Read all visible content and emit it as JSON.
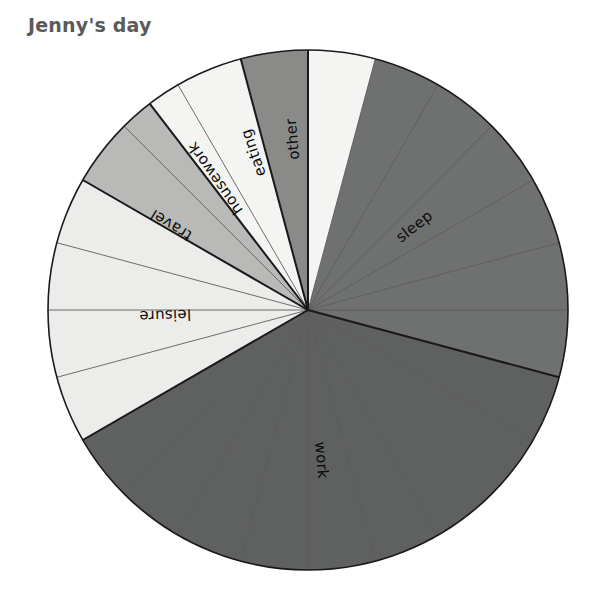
{
  "title": "Jenny's day",
  "chart_data": {
    "type": "pie",
    "title": "Jenny's day",
    "subtitle": "",
    "xlabel": "",
    "ylabel": "",
    "units": "hours",
    "total": 24,
    "start_angle_deg": 0,
    "direction": "clockwise",
    "grid": "hour-spokes",
    "hour_divisions": 24,
    "legend": "none",
    "labels_inside": true,
    "categories": [
      "sleep",
      "work",
      "leisure",
      "travel",
      "housework",
      "eating",
      "other"
    ],
    "values": [
      7,
      9,
      4,
      1.5,
      1.5,
      1,
      0
    ],
    "slices": [
      {
        "label": "sleep",
        "hours": 7,
        "start_hour": 0,
        "end_hour": 7,
        "color": "#6f7070",
        "label_radius_frac": 0.52,
        "label_angle_deg": 52
      },
      {
        "label": "work",
        "hours": 9,
        "start_hour": 7,
        "end_hour": 16,
        "color": "#5f6060",
        "label_radius_frac": 0.58,
        "label_angle_deg": 175
      },
      {
        "label": "leisure",
        "hours": 4,
        "start_hour": 16,
        "end_hour": 20,
        "color": "#ececea",
        "label_radius_frac": 0.55,
        "label_angle_deg": 268
      },
      {
        "label": "travel",
        "hours": 1.5,
        "start_hour": 20,
        "end_hour": 21.5,
        "color": "#b9bab8",
        "label_radius_frac": 0.62,
        "label_angle_deg": 302
      },
      {
        "label": "housework",
        "hours": 1.5,
        "start_hour": 21.5,
        "end_hour": 23,
        "color": "#f4f4f2",
        "label_radius_frac": 0.62,
        "label_angle_deg": 325
      },
      {
        "label": "eating",
        "hours": 1,
        "start_hour": 23,
        "end_hour": 24,
        "color": "#8a8b89",
        "label_radius_frac": 0.64,
        "label_angle_deg": 341
      },
      {
        "label": "other",
        "hours": 1,
        "start_hour": 24,
        "end_hour": 25,
        "color": "#f4f4f2",
        "label_radius_frac": 0.66,
        "label_angle_deg": 355
      }
    ],
    "colors": {
      "sleep": "#6f7070",
      "work": "#5f6060",
      "leisure": "#ececea",
      "travel": "#b9bab8",
      "housework": "#f4f4f2",
      "eating": "#8a8b89",
      "other": "#f4f4f2",
      "outline": "#1a1a1a",
      "hour_line": "#5c5c5c",
      "title": "#5a5a5a",
      "background": "#ffffff"
    },
    "geometry": {
      "cx": 308,
      "cy": 310,
      "r": 260
    }
  }
}
